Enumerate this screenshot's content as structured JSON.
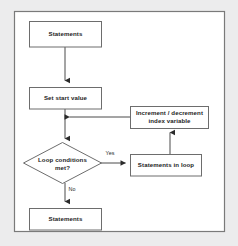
{
  "diagram": {
    "canvas": {
      "width": 238,
      "height": 246
    },
    "colors": {
      "page_background": "#ececed",
      "frame_background": "#ffffff",
      "node_fill": "#ffffff",
      "node_border": "#6d6d6d",
      "connector": "#4a4a4a",
      "arrow": "#2b2b2b",
      "text": "#1d1d1d"
    },
    "nodes": [
      {
        "id": "statements_top",
        "shape": "rectangle",
        "label": "Statements"
      },
      {
        "id": "set_start_value",
        "shape": "rectangle",
        "label": "Set start value"
      },
      {
        "id": "increment_decrement",
        "shape": "rectangle",
        "label_line1": "Increment / decrement",
        "label_line2": "index variable"
      },
      {
        "id": "loop_condition",
        "shape": "diamond",
        "label_line1": "Loop conditions",
        "label_line2": "met?"
      },
      {
        "id": "statements_in_loop",
        "shape": "rectangle",
        "label": "Statements in loop"
      },
      {
        "id": "statements_bottom",
        "shape": "rectangle",
        "label": "Statements"
      }
    ],
    "edge_labels": {
      "yes": "Yes",
      "no": "No"
    }
  }
}
